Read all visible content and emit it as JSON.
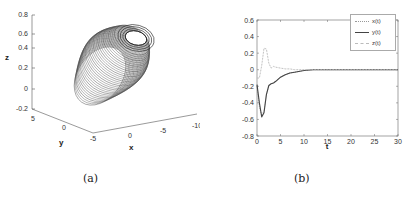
{
  "captions": {
    "a": "(a)",
    "b": "(b)"
  },
  "panel_a": {
    "z_label": "z",
    "y_label": "y",
    "x_label": "x",
    "z_ticks": [
      "0.8",
      "0.6",
      "0.4",
      "0.2",
      "0",
      "-0.2"
    ],
    "y_ticks": [
      "5",
      "0",
      "-5"
    ],
    "x_ticks": [
      "-5",
      "0",
      "-5",
      "-10"
    ]
  },
  "panel_b": {
    "x_label": "t",
    "y_ticks": [
      "0.6",
      "0.4",
      "0.2",
      "0",
      "-0.2",
      "-0.4",
      "-0.6",
      "-0.8"
    ],
    "x_ticks": [
      "0",
      "5",
      "10",
      "15",
      "20",
      "25",
      "30"
    ],
    "legend": [
      {
        "label": "x(t)",
        "style": "dotted",
        "color": "#999999"
      },
      {
        "label": "y(t)",
        "style": "solid",
        "color": "#444444"
      },
      {
        "label": "z(t)",
        "style": "dashed",
        "color": "#bbbbbb"
      }
    ]
  },
  "chart_data": [
    {
      "type": "line",
      "title": "3D phase trajectory (a)",
      "xlabel": "x",
      "ylabel": "y",
      "zlabel": "z",
      "zlim": [
        -0.2,
        0.8
      ],
      "description": "Spiral trajectory forming an elongated torus-like ellipsoidal shell converging toward a ring near z≈0.5",
      "x_ticks": [
        -5,
        0,
        -5,
        -10
      ],
      "y_ticks": [
        5,
        0,
        -5
      ],
      "z_ticks": [
        0.8,
        0.6,
        0.4,
        0.2,
        0,
        -0.2
      ],
      "grid": false
    },
    {
      "type": "line",
      "title": "",
      "xlabel": "t",
      "ylabel": "",
      "xlim": [
        0,
        30
      ],
      "ylim": [
        -0.8,
        0.6
      ],
      "grid": false,
      "legend_position": "top-right",
      "x": [
        0,
        0.5,
        1,
        1.5,
        2,
        2.5,
        3,
        3.5,
        4,
        5,
        6,
        7,
        8,
        10,
        12,
        15,
        20,
        25,
        30
      ],
      "series": [
        {
          "name": "x(t)",
          "values": [
            -0.2,
            -0.45,
            -0.55,
            -0.5,
            -0.3,
            -0.2,
            -0.17,
            -0.16,
            -0.14,
            -0.09,
            -0.06,
            -0.04,
            -0.03,
            -0.01,
            0,
            0,
            0,
            0,
            0
          ]
        },
        {
          "name": "y(t)",
          "values": [
            -0.18,
            -0.4,
            -0.57,
            -0.52,
            -0.3,
            -0.19,
            -0.17,
            -0.16,
            -0.14,
            -0.09,
            -0.06,
            -0.04,
            -0.03,
            -0.01,
            0,
            0,
            0,
            0,
            0
          ]
        },
        {
          "name": "z(t)",
          "values": [
            -0.1,
            -0.1,
            0.05,
            0.26,
            0.25,
            0.08,
            0.02,
            0.04,
            0.03,
            0.02,
            0.01,
            0.01,
            0,
            0,
            0,
            0,
            0,
            0,
            0
          ]
        }
      ]
    }
  ]
}
